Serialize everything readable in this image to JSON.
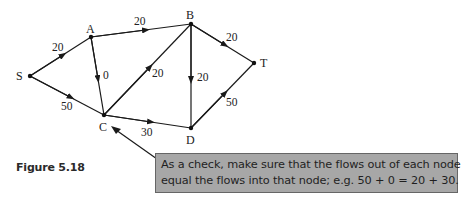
{
  "figure": {
    "caption": "Figure 5.18",
    "callout_text_line1": "As a check, make sure that the flows out of each node",
    "callout_text_line2": "equal the flows into that node; e.g. 50 + 0 = 20 + 30."
  },
  "network": {
    "nodes": {
      "S": {
        "label": "S"
      },
      "A": {
        "label": "A"
      },
      "B": {
        "label": "B"
      },
      "C": {
        "label": "C"
      },
      "D": {
        "label": "D"
      },
      "T": {
        "label": "T"
      }
    },
    "edges": [
      {
        "from": "S",
        "to": "A",
        "flow": "20"
      },
      {
        "from": "S",
        "to": "C",
        "flow": "50"
      },
      {
        "from": "A",
        "to": "B",
        "flow": "20"
      },
      {
        "from": "A",
        "to": "C",
        "flow": "0"
      },
      {
        "from": "C",
        "to": "B",
        "flow": "20"
      },
      {
        "from": "B",
        "to": "D",
        "flow": "20"
      },
      {
        "from": "B",
        "to": "T",
        "flow": "20"
      },
      {
        "from": "C",
        "to": "D",
        "flow": "30"
      },
      {
        "from": "D",
        "to": "T",
        "flow": "50"
      }
    ]
  },
  "colors": {
    "callout_bg": "#a7a7a7",
    "callout_border": "#666666",
    "line": "#1a1a1a"
  }
}
